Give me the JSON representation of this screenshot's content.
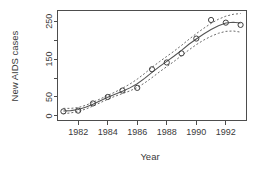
{
  "chart_data": {
    "type": "scatter",
    "title": "",
    "subtitle": "",
    "xlabel": "Year",
    "ylabel": "New AIDS cases",
    "xlim": [
      1980.6,
      1993.4
    ],
    "ylim": [
      -12,
      278
    ],
    "grid": false,
    "legend": null,
    "x_ticks": [
      1982,
      1984,
      1986,
      1988,
      1990,
      1992
    ],
    "x_tick_labels": [
      "1982",
      "1984",
      "1986",
      "1988",
      "1990",
      "1992"
    ],
    "x_minor_ticks": [
      1981,
      1983,
      1985,
      1987,
      1989,
      1991,
      1993
    ],
    "y_ticks": [
      0,
      50,
      150,
      250
    ],
    "y_tick_labels": [
      "0",
      "50",
      "150",
      "250"
    ],
    "y_minor_ticks": [
      100,
      200
    ],
    "points": {
      "name": "Observed new AIDS cases",
      "marker": "open-circle",
      "x": [
        1981,
        1982,
        1983,
        1984,
        1985,
        1986,
        1987,
        1988,
        1989,
        1990,
        1991,
        1992,
        1993
      ],
      "y": [
        12,
        14,
        33,
        50,
        67,
        74,
        123,
        141,
        165,
        204,
        253,
        246,
        240
      ]
    },
    "series": [
      {
        "name": "Fitted curve",
        "style": "solid",
        "x": [
          1981,
          1981.5,
          1982,
          1982.5,
          1983,
          1983.5,
          1984,
          1984.5,
          1985,
          1985.5,
          1986,
          1986.5,
          1987,
          1987.5,
          1988,
          1988.5,
          1989,
          1989.5,
          1990,
          1990.5,
          1991,
          1991.5,
          1992,
          1992.5,
          1993
        ],
        "y": [
          13,
          14,
          17,
          23,
          31,
          40,
          49,
          57,
          65,
          74,
          85,
          99,
          115,
          130,
          144,
          158,
          173,
          189,
          203,
          216,
          228,
          238,
          245,
          247,
          245
        ]
      },
      {
        "name": "Upper confidence band",
        "style": "dashed",
        "x": [
          1981,
          1981.5,
          1982,
          1982.5,
          1983,
          1983.5,
          1984,
          1984.5,
          1985,
          1985.5,
          1986,
          1986.5,
          1987,
          1987.5,
          1988,
          1988.5,
          1989,
          1989.5,
          1990,
          1990.5,
          1991,
          1991.5,
          1992,
          1992.5,
          1993
        ],
        "y": [
          20,
          20,
          22,
          28,
          36,
          45,
          54,
          63,
          73,
          84,
          97,
          112,
          128,
          143,
          157,
          171,
          186,
          202,
          217,
          231,
          244,
          255,
          263,
          268,
          270
        ]
      },
      {
        "name": "Lower confidence band",
        "style": "dashed",
        "x": [
          1981,
          1981.5,
          1982,
          1982.5,
          1983,
          1983.5,
          1984,
          1984.5,
          1985,
          1985.5,
          1986,
          1986.5,
          1987,
          1987.5,
          1988,
          1988.5,
          1989,
          1989.5,
          1990,
          1990.5,
          1991,
          1991.5,
          1992,
          1992.5,
          1993
        ],
        "y": [
          6,
          8,
          12,
          18,
          26,
          35,
          44,
          52,
          59,
          66,
          75,
          87,
          101,
          116,
          130,
          144,
          159,
          174,
          188,
          200,
          210,
          218,
          223,
          224,
          221
        ]
      }
    ]
  }
}
